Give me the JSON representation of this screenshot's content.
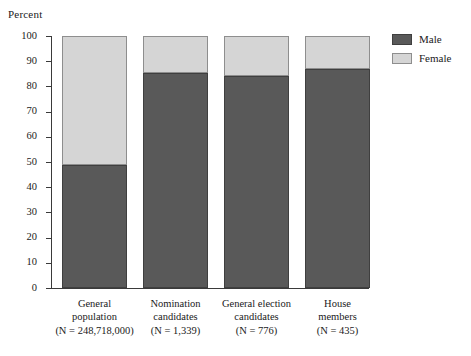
{
  "chart_data": {
    "type": "bar",
    "subtype": "stacked-100-percent",
    "title": "",
    "xlabel": "",
    "ylabel": "Percent",
    "ylim": [
      0,
      100
    ],
    "yticks": [
      0,
      10,
      20,
      30,
      40,
      50,
      60,
      70,
      80,
      90,
      100
    ],
    "grid": false,
    "legend_position": "top-right",
    "categories": [
      "General population",
      "Nomination candidates",
      "General election candidates",
      "House members"
    ],
    "category_lines": [
      [
        "General",
        "population",
        "(N = 248,718,000)"
      ],
      [
        "Nomination",
        "candidates",
        "(N = 1,339)"
      ],
      [
        "General election",
        "candidates",
        "(N = 776)"
      ],
      [
        "House",
        "members",
        "(N = 435)"
      ]
    ],
    "category_n": [
      "248,718,000",
      "1,339",
      "776",
      "435"
    ],
    "series": [
      {
        "name": "Male",
        "color": "#595959",
        "values": [
          48.8,
          85.5,
          84.0,
          87.0
        ]
      },
      {
        "name": "Female",
        "color": "#d5d5d5",
        "values": [
          51.2,
          14.5,
          16.0,
          13.0
        ]
      }
    ]
  },
  "axis": {
    "ylabel": "Percent",
    "tick_labels": [
      "100",
      "90",
      "80",
      "70",
      "60",
      "50",
      "40",
      "30",
      "20",
      "10",
      "0"
    ]
  },
  "legend": {
    "items": [
      {
        "label": "Male",
        "swatch": "male-swatch"
      },
      {
        "label": "Female",
        "swatch": "female-swatch"
      }
    ]
  },
  "colors": {
    "male": "#595959",
    "female": "#d5d5d5",
    "axis": "#3a3a3a",
    "background": "#ffffff"
  }
}
